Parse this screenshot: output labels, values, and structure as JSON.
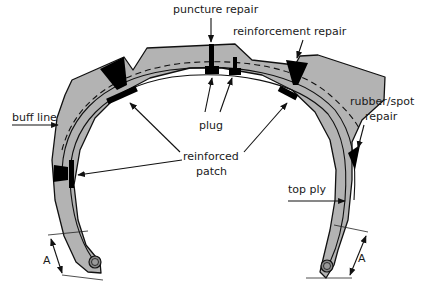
{
  "diagram": {
    "labels": {
      "puncture_repair": "puncture repair",
      "reinforcement_repair": "reinforcement repair",
      "buff_line": "buff line",
      "plug": "plug",
      "rubber_spot_repair_line1": "rubber/spot",
      "rubber_spot_repair_line2": "repair",
      "reinforced_patch_line1": "reinforced",
      "reinforced_patch_line2": "patch",
      "top_ply": "top ply",
      "dimension_left": "A",
      "dimension_right": "A"
    },
    "colors": {
      "rubber": "#b3b3b3",
      "repair": "#000000",
      "outline": "#111111",
      "background": "#ffffff"
    }
  }
}
